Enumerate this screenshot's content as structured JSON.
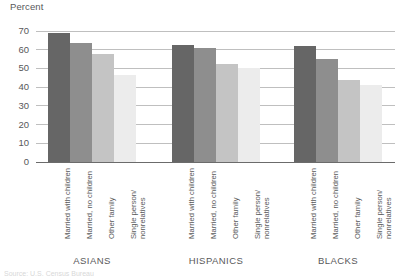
{
  "axis": {
    "ylabel": "Percent",
    "yticks": [
      "70",
      "60",
      "50",
      "40",
      "30",
      "20",
      "10",
      "0"
    ]
  },
  "groups": [
    {
      "title": "ASIANS"
    },
    {
      "title": "HISPANICS"
    },
    {
      "title": "BLACKS"
    }
  ],
  "categories": [
    "Married with children",
    "Married, no children",
    "Other family",
    "Single person/\nnonrelatives"
  ],
  "colors": {
    "series_1": "#666666",
    "series_2": "#8e8e8e",
    "series_3": "#c4c4c4",
    "series_4": "#ececec",
    "gridline": "#bfbfbf",
    "axis": "#6b6b6b",
    "text": "#58585a"
  },
  "source_note": "Source: U.S. Census Bureau",
  "chart_data": {
    "type": "bar",
    "title": "",
    "subtitle": "",
    "xlabel": "",
    "ylabel": "Percent",
    "ylim": [
      0,
      70
    ],
    "ytick_step": 10,
    "grid": true,
    "legend": "none",
    "categories": [
      "ASIANS",
      "HISPANICS",
      "BLACKS"
    ],
    "series": [
      {
        "name": "Married with children",
        "values": [
          69,
          62.5,
          62
        ]
      },
      {
        "name": "Married, no children",
        "values": [
          63.5,
          61,
          55
        ]
      },
      {
        "name": "Other family",
        "values": [
          57.5,
          52.5,
          44
        ]
      },
      {
        "name": "Single person/nonrelatives",
        "values": [
          46.5,
          50,
          41
        ]
      }
    ]
  }
}
